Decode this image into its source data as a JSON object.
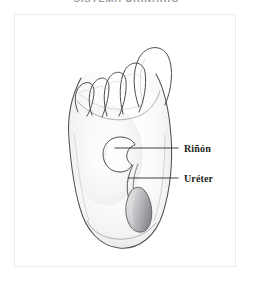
{
  "page": {
    "title": "SISTEMA URINARIO",
    "background_color": "#ffffff"
  },
  "plate": {
    "border_color": "#ececee",
    "background_color": "#ffffff"
  },
  "figure": {
    "kind": "pencil-sketch-anatomical-diagram",
    "line_color": "#4a4a4a",
    "shade_color": "#b9b9bc",
    "organs": [
      {
        "id": "kidney",
        "name": "Rinon"
      },
      {
        "id": "ureter",
        "name": "Ureter"
      },
      {
        "id": "bladder",
        "name": "Vejiga"
      }
    ]
  },
  "annotations": [
    {
      "id": "kidney",
      "label": "Riñón",
      "leader_line_color": "#2b2b2b"
    },
    {
      "id": "ureter",
      "label": "Uréter",
      "leader_line_color": "#2b2b2b"
    }
  ]
}
